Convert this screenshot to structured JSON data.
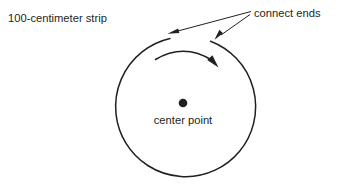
{
  "figure": {
    "background_color": "#ffffff",
    "ink_color": "#231f20",
    "width": 339,
    "height": 189,
    "labels": {
      "strip": "100-centimeter strip",
      "connect_ends": "connect ends",
      "center_point": "center point"
    },
    "shapes": {
      "circle": {
        "name": "strip-circle",
        "center_x": 178,
        "center_y": 108,
        "radius": 70,
        "gap_top": true
      },
      "center_dot": {
        "name": "center-point-dot",
        "x": 183,
        "y": 103,
        "radius": 4
      },
      "rotation_arrow": {
        "name": "clockwise-rotation-arrow",
        "direction": "clockwise"
      },
      "leader_arrows": [
        {
          "name": "leader-arrow-left-end",
          "from_x": 250,
          "from_y": 13,
          "to_x": 172,
          "to_y": 33
        },
        {
          "name": "leader-arrow-right-end",
          "from_x": 250,
          "from_y": 14,
          "to_x": 216,
          "to_y": 39
        }
      ]
    }
  }
}
